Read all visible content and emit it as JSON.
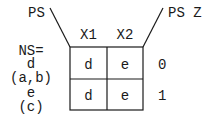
{
  "diagram": {
    "corner_left_label": "PS",
    "corner_right_label": "PS Z",
    "column_headers": [
      "X1",
      "X2"
    ],
    "row_header_title": "NS=",
    "rows": [
      {
        "label": "d",
        "sublabel": "(a,b)",
        "cells": [
          "d",
          "e"
        ],
        "output": "0"
      },
      {
        "label": "e",
        "sublabel": "(c)",
        "cells": [
          "d",
          "e"
        ],
        "output": "1"
      }
    ]
  }
}
